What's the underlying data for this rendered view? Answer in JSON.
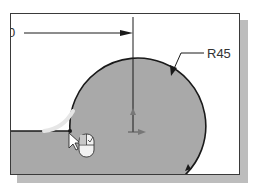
{
  "diagram": {
    "dimension_horizontal": {
      "label": "0",
      "partial": true
    },
    "dimension_radius": {
      "label": "R45"
    },
    "colors": {
      "fill": "#a9a9a9",
      "stroke": "#1a1a1a",
      "highlight": "#e6e6e6",
      "background": "#ffffff",
      "shadow": "#bdbdbd"
    },
    "icons": [
      "cursor-arrow-icon",
      "mouse-left-click-icon",
      "center-point-icon"
    ]
  }
}
